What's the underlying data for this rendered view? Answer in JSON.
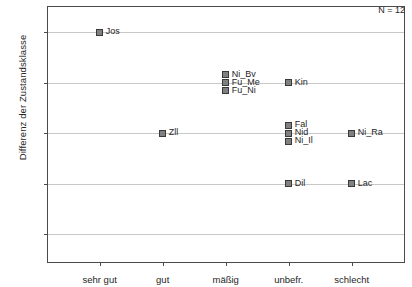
{
  "chart_data": {
    "type": "scatter",
    "title": "",
    "subtitle": "",
    "xlabel": "",
    "ylabel": "Differenz der Zustandsklasse",
    "categories": [
      "sehr gut",
      "gut",
      "mäßig",
      "unbefr.",
      "schlecht"
    ],
    "ytick_labels": [
      "+ 2",
      "+ 1",
      "0",
      "- 1",
      "- 2"
    ],
    "ytick_values": [
      2,
      1,
      0,
      -1,
      -2
    ],
    "ylim": [
      -2.55,
      2.5
    ],
    "grid": "horizontal",
    "legend": "none",
    "annotations": [
      {
        "text": "N = 12",
        "position": "top-right"
      }
    ],
    "points": [
      {
        "label": "Jos",
        "category": "sehr gut",
        "x_index": 0,
        "y": 2.0,
        "label_side": "right"
      },
      {
        "label": "Zll",
        "category": "gut",
        "x_index": 1,
        "y": 0.0,
        "label_side": "right"
      },
      {
        "label": "Ni_Bv",
        "category": "mäßig",
        "x_index": 2,
        "y": 1.16,
        "label_side": "right-above"
      },
      {
        "label": "Fu_Me",
        "category": "mäßig",
        "x_index": 2,
        "y": 1.0,
        "label_side": "right"
      },
      {
        "label": "Fu_Ni",
        "category": "mäßig",
        "x_index": 2,
        "y": 0.84,
        "label_side": "right-below"
      },
      {
        "label": "Kin",
        "category": "unbefr.",
        "x_index": 3,
        "y": 1.0,
        "label_side": "right"
      },
      {
        "label": "Fal",
        "category": "unbefr.",
        "x_index": 3,
        "y": 0.16,
        "label_side": "right-above"
      },
      {
        "label": "Nid",
        "category": "unbefr.",
        "x_index": 3,
        "y": 0.0,
        "label_side": "right"
      },
      {
        "label": "Ni_Il",
        "category": "unbefr.",
        "x_index": 3,
        "y": -0.16,
        "label_side": "right-below"
      },
      {
        "label": "Ni_Ra",
        "category": "schlecht",
        "x_index": 4,
        "y": 0.0,
        "label_side": "right"
      },
      {
        "label": "Dil",
        "category": "unbefr.",
        "x_index": 3,
        "y": -1.0,
        "label_side": "right"
      },
      {
        "label": "Lac",
        "category": "schlecht",
        "x_index": 4,
        "y": -1.0,
        "label_side": "right"
      }
    ],
    "n_total": 12,
    "marker": {
      "shape": "square",
      "fill_color": "#808080",
      "edge_color": "#3a3a3a",
      "size_px": 7
    },
    "colors": {
      "background": "#ffffff",
      "axis": "#4a4a4a",
      "grid": "#c8c8c8",
      "text": "#262626"
    }
  }
}
